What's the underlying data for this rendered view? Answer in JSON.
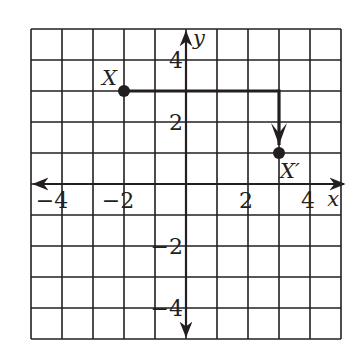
{
  "diagram": {
    "type": "coordinate-grid-translation",
    "grid": {
      "x_min": -5,
      "x_max": 5,
      "y_min": -5,
      "y_max": 5,
      "cell_px": 31
    },
    "axes": {
      "x_label": "x",
      "y_label": "y",
      "x_ticks": [
        {
          "value": -4,
          "label": "−4"
        },
        {
          "value": -2,
          "label": "−2"
        },
        {
          "value": 2,
          "label": "2"
        },
        {
          "value": 4,
          "label": "4"
        }
      ],
      "y_ticks": [
        {
          "value": 4,
          "label": "4"
        },
        {
          "value": 2,
          "label": "2"
        },
        {
          "value": -2,
          "label": "−2"
        },
        {
          "value": -4,
          "label": "−4"
        }
      ]
    },
    "points": [
      {
        "name": "X",
        "label": "X",
        "x": -2,
        "y": 3
      },
      {
        "name": "X-prime",
        "label": "X′",
        "x": 3,
        "y": 1
      }
    ],
    "path": {
      "description": "Translation from X: 5 units right, then 2 units down to X′",
      "vertices": [
        [
          -2,
          3
        ],
        [
          3,
          3
        ],
        [
          3,
          1
        ]
      ]
    },
    "colors": {
      "ink": "#231f20",
      "background": "#ffffff"
    }
  }
}
